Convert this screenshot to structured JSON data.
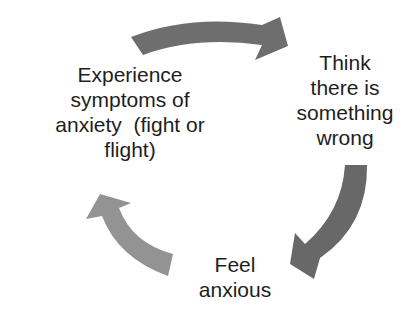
{
  "diagram": {
    "type": "cycle",
    "nodes": [
      {
        "id": "experience",
        "lines": [
          "Experience",
          "symptoms of",
          "anxiety  (fight or",
          "flight)"
        ]
      },
      {
        "id": "think",
        "lines": [
          "Think",
          "there is",
          "something",
          "wrong"
        ]
      },
      {
        "id": "feel",
        "lines": [
          "Feel",
          "anxious"
        ]
      }
    ],
    "edges": [
      {
        "from": "experience",
        "to": "think",
        "color": "#6e6e6e"
      },
      {
        "from": "think",
        "to": "feel",
        "color": "#686868"
      },
      {
        "from": "feel",
        "to": "experience",
        "color": "#939393"
      }
    ]
  }
}
